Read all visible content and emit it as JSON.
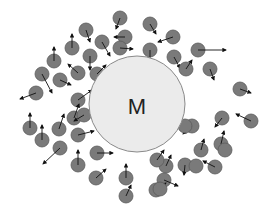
{
  "diagram": {
    "type": "particle-diagram",
    "colors": {
      "background": "#ffffff",
      "big_particle_fill": "#ebebeb",
      "big_particle_stroke": "#8a8a8a",
      "small_particle_fill": "#7a7a7a",
      "small_particle_stroke": "#5c5c5c",
      "arrow": "#111111",
      "label": "#222222"
    },
    "big_particle": {
      "label": "M",
      "cx": 137,
      "cy": 104,
      "r": 48
    },
    "small_particle_radius": 7,
    "particles": [
      {
        "x": 120,
        "y": 18,
        "ax": 116,
        "ay": 29
      },
      {
        "x": 150,
        "y": 24,
        "ax": 156,
        "ay": 34
      },
      {
        "x": 173,
        "y": 37,
        "ax": 158,
        "ay": 42
      },
      {
        "x": 86,
        "y": 30,
        "ax": 90,
        "ay": 42
      },
      {
        "x": 125,
        "y": 37,
        "ax": 114,
        "ay": 37
      },
      {
        "x": 102,
        "y": 42,
        "ax": 110,
        "ay": 56
      },
      {
        "x": 120,
        "y": 48,
        "ax": 133,
        "ay": 49
      },
      {
        "x": 150,
        "y": 50,
        "ax": 150,
        "ay": 62
      },
      {
        "x": 174,
        "y": 57,
        "ax": 180,
        "ay": 68
      },
      {
        "x": 198,
        "y": 50,
        "ax": 226,
        "ay": 50
      },
      {
        "x": 72,
        "y": 48,
        "ax": 72,
        "ay": 34
      },
      {
        "x": 90,
        "y": 56,
        "ax": 90,
        "ay": 70
      },
      {
        "x": 54,
        "y": 61,
        "ax": 54,
        "ay": 47
      },
      {
        "x": 78,
        "y": 73,
        "ax": 68,
        "ay": 64
      },
      {
        "x": 60,
        "y": 80,
        "ax": 71,
        "ay": 85
      },
      {
        "x": 42,
        "y": 74,
        "ax": 52,
        "ay": 93
      },
      {
        "x": 97,
        "y": 74,
        "ax": 106,
        "ay": 65
      },
      {
        "x": 78,
        "y": 100,
        "ax": 92,
        "ay": 90
      },
      {
        "x": 36,
        "y": 93,
        "ax": 20,
        "ay": 99
      },
      {
        "x": 186,
        "y": 69,
        "ax": 192,
        "ay": 60
      },
      {
        "x": 210,
        "y": 69,
        "ax": 214,
        "ay": 80
      },
      {
        "x": 240,
        "y": 89,
        "ax": 251,
        "ay": 93
      },
      {
        "x": 74,
        "y": 118,
        "ax": 79,
        "ay": 104
      },
      {
        "x": 59,
        "y": 129,
        "ax": 64,
        "ay": 114
      },
      {
        "x": 30,
        "y": 128,
        "ax": 30,
        "ay": 113
      },
      {
        "x": 84,
        "y": 115,
        "ax": 74,
        "ay": 121
      },
      {
        "x": 42,
        "y": 140,
        "ax": 42,
        "ay": 125
      },
      {
        "x": 78,
        "y": 135,
        "ax": 94,
        "ay": 131
      },
      {
        "x": 60,
        "y": 148,
        "ax": 43,
        "ay": 164
      },
      {
        "x": 97,
        "y": 153,
        "ax": 113,
        "ay": 153
      },
      {
        "x": 78,
        "y": 165,
        "ax": 78,
        "ay": 150
      },
      {
        "x": 96,
        "y": 178,
        "ax": 106,
        "ay": 169
      },
      {
        "x": 126,
        "y": 178,
        "ax": 126,
        "ay": 164
      },
      {
        "x": 126,
        "y": 196,
        "ax": 131,
        "ay": 185
      },
      {
        "x": 222,
        "y": 118,
        "ax": 215,
        "ay": 127
      },
      {
        "x": 192,
        "y": 126,
        "ax": 183,
        "ay": 134
      },
      {
        "x": 201,
        "y": 150,
        "ax": 204,
        "ay": 139
      },
      {
        "x": 221,
        "y": 144,
        "ax": 224,
        "ay": 131
      },
      {
        "x": 215,
        "y": 167,
        "ax": 203,
        "ay": 161
      },
      {
        "x": 251,
        "y": 121,
        "ax": 236,
        "ay": 114
      },
      {
        "x": 185,
        "y": 126,
        "ax": 185,
        "ay": 126
      },
      {
        "x": 166,
        "y": 166,
        "ax": 171,
        "ay": 155
      },
      {
        "x": 164,
        "y": 180,
        "ax": 178,
        "ay": 186
      },
      {
        "x": 185,
        "y": 165,
        "ax": 184,
        "ay": 175
      },
      {
        "x": 156,
        "y": 190,
        "ax": 166,
        "ay": 183
      },
      {
        "x": 196,
        "y": 166,
        "ax": 196,
        "ay": 166
      },
      {
        "x": 160,
        "y": 189,
        "ax": 160,
        "ay": 189
      },
      {
        "x": 225,
        "y": 150,
        "ax": 225,
        "ay": 150
      },
      {
        "x": 162,
        "y": 134,
        "ax": 158,
        "ay": 124
      },
      {
        "x": 157,
        "y": 160,
        "ax": 164,
        "ay": 150
      }
    ]
  }
}
